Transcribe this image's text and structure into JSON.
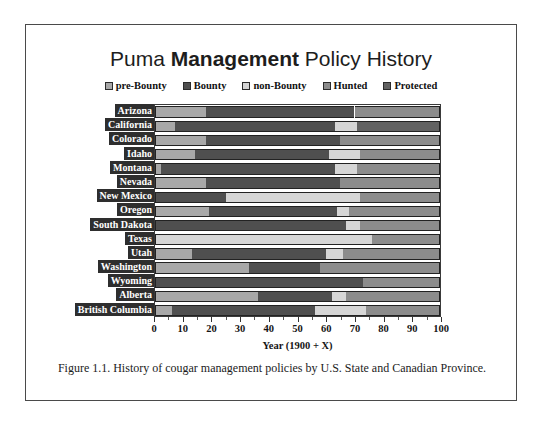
{
  "figure": {
    "title_part1": "Puma ",
    "title_part2": "Management",
    "title_part3": " Policy History",
    "title_full": "Puma Management Policy History",
    "caption": "Figure 1.1. History of cougar management policies by U.S. State and Canadian Province."
  },
  "chart_data": {
    "type": "bar",
    "orientation": "horizontal",
    "stacked": true,
    "title": "Puma Management Policy History",
    "xlabel": "Year (1900 + X)",
    "ylabel": "",
    "xlim": [
      0,
      100
    ],
    "xticks": [
      0,
      10,
      20,
      30,
      40,
      50,
      60,
      70,
      80,
      90,
      100
    ],
    "xtick_labels": [
      "0",
      "10",
      "20",
      "30",
      "40",
      "50",
      "60",
      "70",
      "80",
      "90",
      "100"
    ],
    "grid": false,
    "legend_position": "top",
    "legend": [
      "pre-Bounty",
      "Bounty",
      "non-Bounty",
      "Hunted",
      "Protected"
    ],
    "colors": {
      "pre-Bounty": "#a8a8a8",
      "Bounty": "#4f4f4f",
      "non-Bounty": "#d6d6d6",
      "Hunted": "#8c8c8c",
      "Protected": "#626262"
    },
    "categories": [
      "Arizona",
      "California",
      "Colorado",
      "Idaho",
      "Montana",
      "Nevada",
      "New Mexico",
      "Oregon",
      "South Dakota",
      "Texas",
      "Utah",
      "Washington",
      "Wyoming",
      "Alberta",
      "British Columbia"
    ],
    "series": [
      {
        "name": "pre-Bounty",
        "values": [
          18,
          7,
          18,
          14,
          2,
          18,
          0,
          19,
          0,
          0,
          13,
          33,
          0,
          36,
          6
        ]
      },
      {
        "name": "Bounty",
        "values": [
          52,
          56,
          47,
          47,
          61,
          47,
          25,
          45,
          67,
          0,
          47,
          25,
          73,
          26,
          50
        ]
      },
      {
        "name": "non-Bounty",
        "values": [
          0,
          8,
          0,
          11,
          8,
          0,
          47,
          4,
          5,
          76,
          6,
          0,
          0,
          5,
          18
        ]
      },
      {
        "name": "Hunted",
        "values": [
          30,
          0,
          35,
          28,
          29,
          35,
          28,
          32,
          28,
          24,
          34,
          42,
          27,
          33,
          26
        ]
      },
      {
        "name": "Protected",
        "values": [
          0,
          29,
          0,
          0,
          0,
          0,
          0,
          0,
          0,
          0,
          0,
          0,
          0,
          0,
          0
        ]
      }
    ],
    "rows": [
      {
        "category": "Arizona",
        "segments": [
          {
            "label": "pre-Bounty",
            "start": 0,
            "end": 18
          },
          {
            "label": "Bounty",
            "start": 18,
            "end": 70
          },
          {
            "label": "Hunted",
            "start": 70,
            "end": 100
          }
        ]
      },
      {
        "category": "California",
        "segments": [
          {
            "label": "pre-Bounty",
            "start": 0,
            "end": 7
          },
          {
            "label": "Bounty",
            "start": 7,
            "end": 63
          },
          {
            "label": "non-Bounty",
            "start": 63,
            "end": 71
          },
          {
            "label": "Protected",
            "start": 71,
            "end": 100
          }
        ]
      },
      {
        "category": "Colorado",
        "segments": [
          {
            "label": "pre-Bounty",
            "start": 0,
            "end": 18
          },
          {
            "label": "Bounty",
            "start": 18,
            "end": 65
          },
          {
            "label": "Hunted",
            "start": 65,
            "end": 100
          }
        ]
      },
      {
        "category": "Idaho",
        "segments": [
          {
            "label": "pre-Bounty",
            "start": 0,
            "end": 14
          },
          {
            "label": "Bounty",
            "start": 14,
            "end": 61
          },
          {
            "label": "non-Bounty",
            "start": 61,
            "end": 72
          },
          {
            "label": "Hunted",
            "start": 72,
            "end": 100
          }
        ]
      },
      {
        "category": "Montana",
        "segments": [
          {
            "label": "pre-Bounty",
            "start": 0,
            "end": 2
          },
          {
            "label": "Bounty",
            "start": 2,
            "end": 63
          },
          {
            "label": "non-Bounty",
            "start": 63,
            "end": 71
          },
          {
            "label": "Hunted",
            "start": 71,
            "end": 100
          }
        ]
      },
      {
        "category": "Nevada",
        "segments": [
          {
            "label": "pre-Bounty",
            "start": 0,
            "end": 18
          },
          {
            "label": "Bounty",
            "start": 18,
            "end": 65
          },
          {
            "label": "Hunted",
            "start": 65,
            "end": 100
          }
        ]
      },
      {
        "category": "New Mexico",
        "segments": [
          {
            "label": "Bounty",
            "start": 0,
            "end": 25
          },
          {
            "label": "non-Bounty",
            "start": 25,
            "end": 72
          },
          {
            "label": "Hunted",
            "start": 72,
            "end": 100
          }
        ]
      },
      {
        "category": "Oregon",
        "segments": [
          {
            "label": "pre-Bounty",
            "start": 0,
            "end": 19
          },
          {
            "label": "Bounty",
            "start": 19,
            "end": 64
          },
          {
            "label": "non-Bounty",
            "start": 64,
            "end": 68
          },
          {
            "label": "Hunted",
            "start": 68,
            "end": 100
          }
        ]
      },
      {
        "category": "South Dakota",
        "segments": [
          {
            "label": "Bounty",
            "start": 0,
            "end": 67
          },
          {
            "label": "non-Bounty",
            "start": 67,
            "end": 72
          },
          {
            "label": "Hunted",
            "start": 72,
            "end": 100
          }
        ]
      },
      {
        "category": "Texas",
        "segments": [
          {
            "label": "non-Bounty",
            "start": 0,
            "end": 76
          },
          {
            "label": "Hunted",
            "start": 76,
            "end": 100
          }
        ]
      },
      {
        "category": "Utah",
        "segments": [
          {
            "label": "pre-Bounty",
            "start": 0,
            "end": 13
          },
          {
            "label": "Bounty",
            "start": 13,
            "end": 60
          },
          {
            "label": "non-Bounty",
            "start": 60,
            "end": 66
          },
          {
            "label": "Hunted",
            "start": 66,
            "end": 100
          }
        ]
      },
      {
        "category": "Washington",
        "segments": [
          {
            "label": "pre-Bounty",
            "start": 0,
            "end": 33
          },
          {
            "label": "Bounty",
            "start": 33,
            "end": 58
          },
          {
            "label": "Hunted",
            "start": 58,
            "end": 100
          }
        ]
      },
      {
        "category": "Wyoming",
        "segments": [
          {
            "label": "Bounty",
            "start": 0,
            "end": 73
          },
          {
            "label": "Hunted",
            "start": 73,
            "end": 100
          }
        ]
      },
      {
        "category": "Alberta",
        "segments": [
          {
            "label": "pre-Bounty",
            "start": 0,
            "end": 36
          },
          {
            "label": "Bounty",
            "start": 36,
            "end": 62
          },
          {
            "label": "non-Bounty",
            "start": 62,
            "end": 67
          },
          {
            "label": "Hunted",
            "start": 67,
            "end": 100
          }
        ]
      },
      {
        "category": "British Columbia",
        "segments": [
          {
            "label": "pre-Bounty",
            "start": 0,
            "end": 6
          },
          {
            "label": "Bounty",
            "start": 6,
            "end": 56
          },
          {
            "label": "non-Bounty",
            "start": 56,
            "end": 74
          },
          {
            "label": "Hunted",
            "start": 74,
            "end": 100
          }
        ]
      }
    ]
  }
}
